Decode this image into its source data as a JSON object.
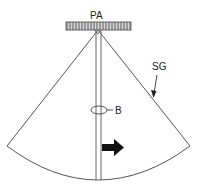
{
  "diagram": {
    "type": "ultrasound-sector-scan-schematic",
    "labels": {
      "probe": "PA",
      "sector": "SG",
      "beam_marker": "B"
    },
    "elements": [
      {
        "id": "PA",
        "description": "phased array transducer bar at top"
      },
      {
        "id": "SG",
        "description": "sector-shaped image field (fan), pointed to by arrow"
      },
      {
        "id": "B",
        "description": "elliptical marker on central beam line"
      },
      {
        "id": "arrow",
        "description": "solid black arrow pointing right, adjacent to central beam"
      }
    ],
    "colors": {
      "line": "#555555",
      "probe_fill": "#c8c8c8",
      "arrow_fill": "#111111",
      "background": "#ffffff"
    }
  }
}
